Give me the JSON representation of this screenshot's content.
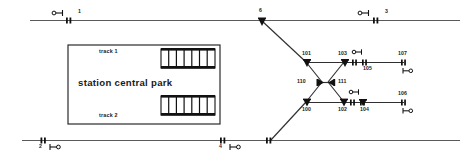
{
  "diagram": {
    "type": "railway-interlocking-schematic",
    "colors": {
      "track": "#3a3a3a",
      "track_main": "#555555",
      "symbol": "#111111",
      "text": "#1a1a1a",
      "background": "#ffffff"
    },
    "station_box": {
      "title": "station central park",
      "track_1_label": "track  1",
      "track_2_label": "track  2"
    },
    "main_track_signals": [
      {
        "id": "sig-1",
        "label": "1",
        "x": 78,
        "y": 20,
        "marker_x": 68,
        "sym_x": 52,
        "sym_y": 13,
        "dir": "right"
      },
      {
        "id": "sig-3",
        "label": "3",
        "x": 385,
        "y": 20,
        "marker_x": 375,
        "sym_x": 358,
        "sym_y": 13,
        "dir": "right"
      },
      {
        "id": "sig-2",
        "label": "2",
        "x": 39,
        "y": 146,
        "marker_x": 42,
        "sym_x": 50,
        "sym_y": 145,
        "dir": "right-below"
      },
      {
        "id": "sig-4",
        "label": "4",
        "x": 219,
        "y": 146,
        "marker_x": 222,
        "sym_x": 230,
        "sym_y": 145,
        "dir": "right-below"
      }
    ],
    "switches": [
      {
        "id": "sw-6",
        "label": "6",
        "x": 259,
        "y": 11
      },
      {
        "id": "sw-101",
        "label": "101",
        "x": 306,
        "y": 53
      },
      {
        "id": "sw-103",
        "label": "103",
        "x": 344,
        "y": 53
      },
      {
        "id": "sw-110",
        "label": "110",
        "x": 306,
        "y": 75
      },
      {
        "id": "sw-111",
        "label": "111",
        "x": 341,
        "y": 75
      },
      {
        "id": "sw-100",
        "label": "100",
        "x": 306,
        "y": 108
      },
      {
        "id": "sw-102",
        "label": "102",
        "x": 341,
        "y": 108
      },
      {
        "id": "sw-104",
        "label": "104",
        "x": 362,
        "y": 108
      }
    ],
    "yard_signals": [
      {
        "id": "sig-105",
        "label": "105",
        "x": 367,
        "y": 66
      },
      {
        "id": "sig-107",
        "label": "107",
        "x": 414,
        "y": 44
      },
      {
        "id": "sig-106",
        "label": "106",
        "x": 414,
        "y": 90
      }
    ]
  }
}
